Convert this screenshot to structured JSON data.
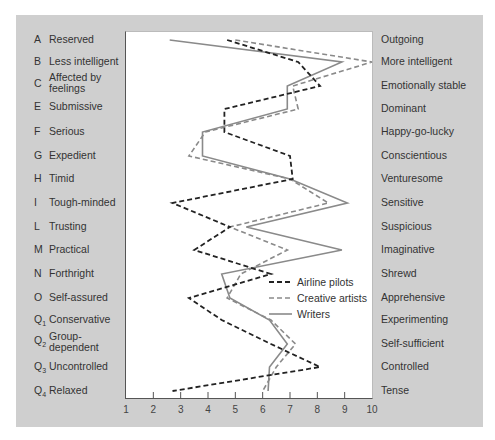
{
  "chart_data": {
    "type": "line",
    "orientation": "horizontal-profile",
    "title": "",
    "xlabel": "",
    "ylabel": "",
    "xlim": [
      1,
      10
    ],
    "x_ticks": [
      "1",
      "2",
      "3",
      "4",
      "5",
      "6",
      "7",
      "8",
      "9",
      "10"
    ],
    "grid": false,
    "legend_position": "inside-lower-right",
    "categories": [
      {
        "code": "A",
        "sub": "",
        "low": "Reserved",
        "high": "Outgoing"
      },
      {
        "code": "B",
        "sub": "",
        "low": "Less intelligent",
        "high": "More intelligent"
      },
      {
        "code": "C",
        "sub": "",
        "low": "Affected by feelings",
        "high": "Emotionally stable"
      },
      {
        "code": "E",
        "sub": "",
        "low": "Submissive",
        "high": "Dominant"
      },
      {
        "code": "F",
        "sub": "",
        "low": "Serious",
        "high": "Happy-go-lucky"
      },
      {
        "code": "G",
        "sub": "",
        "low": "Expedient",
        "high": "Conscientious"
      },
      {
        "code": "H",
        "sub": "",
        "low": "Timid",
        "high": "Venturesome"
      },
      {
        "code": "I",
        "sub": "",
        "low": "Tough-minded",
        "high": "Sensitive"
      },
      {
        "code": "L",
        "sub": "",
        "low": "Trusting",
        "high": "Suspicious"
      },
      {
        "code": "M",
        "sub": "",
        "low": "Practical",
        "high": "Imaginative"
      },
      {
        "code": "N",
        "sub": "",
        "low": "Forthright",
        "high": "Shrewd"
      },
      {
        "code": "O",
        "sub": "",
        "low": "Self-assured",
        "high": "Apprehensive"
      },
      {
        "code": "Q",
        "sub": "1",
        "low": "Conservative",
        "high": "Experimenting"
      },
      {
        "code": "Q",
        "sub": "2",
        "low": "Group-dependent",
        "high": "Self-sufficient"
      },
      {
        "code": "Q",
        "sub": "3",
        "low": "Uncontrolled",
        "high": "Controlled"
      },
      {
        "code": "Q",
        "sub": "4",
        "low": "Relaxed",
        "high": "Tense"
      }
    ],
    "series": [
      {
        "name": "Airline pilots",
        "style": "dashed",
        "color": "#222222",
        "values": [
          4.7,
          7.3,
          8.1,
          4.6,
          4.6,
          7.0,
          7.1,
          2.7,
          4.8,
          3.5,
          6.3,
          3.3,
          4.5,
          6.3,
          8.1,
          2.7
        ]
      },
      {
        "name": "Creative artists",
        "style": "dashed",
        "color": "#8a8a8a",
        "values": [
          5.0,
          10.0,
          7.1,
          7.3,
          3.9,
          3.3,
          7.0,
          8.4,
          4.8,
          6.9,
          5.2,
          4.7,
          6.3,
          7.2,
          6.5,
          6.0
        ]
      },
      {
        "name": "Writers",
        "style": "solid",
        "color": "#8a8a8a",
        "values": [
          2.6,
          8.9,
          6.9,
          6.9,
          3.8,
          3.8,
          7.0,
          9.1,
          5.4,
          8.9,
          4.5,
          4.8,
          6.25,
          6.9,
          6.25,
          6.2
        ]
      }
    ]
  },
  "legend": {
    "items": [
      {
        "label": "Airline pilots"
      },
      {
        "label": "Creative artists"
      },
      {
        "label": "Writers"
      }
    ]
  }
}
